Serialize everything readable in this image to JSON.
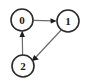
{
  "figure": {
    "width": 86,
    "height": 83,
    "background_color": "#ffffff"
  },
  "style": {
    "node_fill": "#ffffff",
    "node_stroke": "#2b2b2b",
    "node_radius": 11,
    "label_color": "#171717",
    "edge_color": "#6b6b6b",
    "arrowhead_color": "#1d1d1d"
  },
  "graph": {
    "type": "directed",
    "nodes": [
      {
        "id": "0",
        "label": "0",
        "cx": 22,
        "cy": 20
      },
      {
        "id": "1",
        "label": "1",
        "cx": 68,
        "cy": 21
      },
      {
        "id": "2",
        "label": "2",
        "cx": 23,
        "cy": 66
      }
    ],
    "edges": [
      {
        "id": "0-1",
        "from": "0",
        "to": "1",
        "label": "",
        "shape": "horizontal"
      },
      {
        "id": "1-2",
        "from": "1",
        "to": "2",
        "label": "",
        "shape": "diagonal"
      },
      {
        "id": "2-0",
        "from": "2",
        "to": "0",
        "label": "",
        "shape": "vertical"
      }
    ]
  }
}
